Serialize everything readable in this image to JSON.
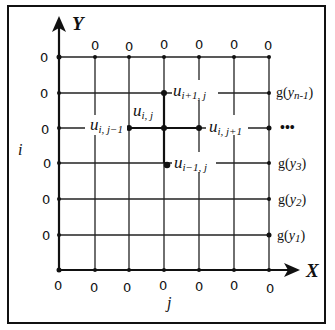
{
  "diagram": {
    "type": "finite-difference-grid",
    "axes": {
      "x_label": "X",
      "y_label": "Y",
      "row_index_label": "i",
      "col_index_label": "j"
    },
    "columns_x": [
      59,
      95,
      129,
      164,
      199,
      234,
      269
    ],
    "rows_y": [
      57,
      93,
      128,
      163,
      199,
      235,
      270
    ],
    "top_boundary_values": [
      "0",
      "0",
      "0",
      "0",
      "0",
      "0"
    ],
    "left_boundary_values": [
      "0",
      "0",
      "0",
      "0",
      "0",
      "0"
    ],
    "bottom_boundary_values": [
      "0",
      "0",
      "0",
      "0",
      "0",
      "0",
      "0"
    ],
    "right_boundary_labels": [
      {
        "base": "g",
        "var": "y",
        "sub": "n-1",
        "row": 1
      },
      {
        "base": "…",
        "row": 2
      },
      {
        "base": "g",
        "var": "y",
        "sub": "3",
        "row": 3
      },
      {
        "base": "g",
        "var": "y",
        "sub": "2",
        "row": 4
      },
      {
        "base": "g",
        "var": "y",
        "sub": "1",
        "row": 5
      }
    ],
    "stencil_nodes": [
      {
        "name": "u",
        "sub": "i+1, j",
        "position": "top"
      },
      {
        "name": "u",
        "sub": "i, j",
        "position": "center"
      },
      {
        "name": "u",
        "sub": "i, j-1",
        "position": "left"
      },
      {
        "name": "u",
        "sub": "i, j+1",
        "position": "right"
      },
      {
        "name": "u",
        "sub": "i-1, j",
        "position": "bottom"
      }
    ],
    "ellipsis": "•••"
  },
  "labels": {
    "y_axis": "Y",
    "x_axis": "X",
    "i": "i",
    "j": "j",
    "zero": "0",
    "u": "u",
    "g": "g",
    "u_top_sub": "i+1, j",
    "u_center_sub": "i, j",
    "u_left_sub": "i, j−1",
    "u_right_sub": "i, j+1",
    "u_bottom_sub": "i−1, j",
    "g1_sub": "n-1",
    "g3_sub": "3",
    "g4_sub": "2",
    "g5_sub": "1",
    "y_var": "y",
    "ellipsis": "•••"
  }
}
